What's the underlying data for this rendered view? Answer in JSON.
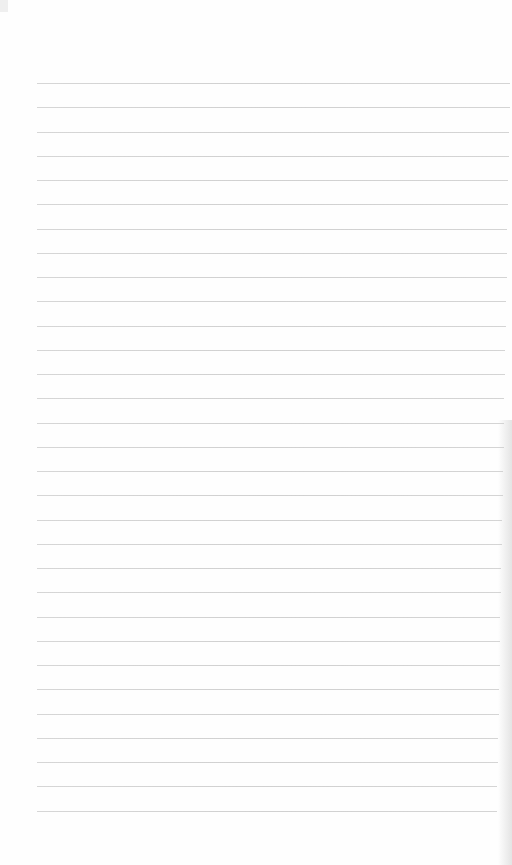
{
  "page": {
    "type": "lined-paper",
    "background_color": "#fefefe",
    "rule_color": "#c8c8c8",
    "rule_count": 31,
    "first_rule_y": 83,
    "rule_spacing": 24.25,
    "rule_left": 37,
    "rule_right_top": 510,
    "rule_right_bottom": 497
  }
}
